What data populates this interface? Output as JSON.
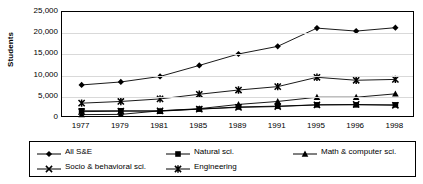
{
  "chart_data": {
    "type": "line",
    "title": "",
    "xlabel": "",
    "ylabel": "Students",
    "categories": [
      "1977",
      "1979",
      "1981",
      "1985",
      "1989",
      "1991",
      "1995",
      "1996",
      "1998"
    ],
    "ylim": [
      0,
      25000
    ],
    "ytick_labels": [
      "25,000",
      "20,000",
      "15,000",
      "10,000",
      "5,000",
      "0"
    ],
    "ytick_values": [
      25000,
      20000,
      15000,
      10000,
      5000,
      0
    ],
    "grid": true,
    "legend_position": "bottom",
    "series": [
      {
        "name": "All S&E",
        "marker": "diamond",
        "values": [
          7800,
          8500,
          9800,
          12400,
          15100,
          16900,
          21200,
          20500,
          21300
        ]
      },
      {
        "name": "Natural sci.",
        "marker": "square",
        "values": [
          1700,
          1700,
          1600,
          2100,
          2600,
          2800,
          3100,
          3100,
          3100
        ]
      },
      {
        "name": "Math & computer sci.",
        "marker": "triangle",
        "values": [
          800,
          850,
          1700,
          2200,
          3200,
          3900,
          4900,
          4900,
          5700
        ]
      },
      {
        "name": "Socio & behavioral sci.",
        "marker": "x",
        "values": [
          1500,
          1600,
          1700,
          2100,
          2500,
          2700,
          3100,
          3200,
          3000
        ]
      },
      {
        "name": "Engineering",
        "marker": "asterisk",
        "values": [
          3500,
          3900,
          4500,
          5600,
          6600,
          7400,
          9600,
          8900,
          9100
        ]
      }
    ]
  },
  "legend": {
    "items": [
      {
        "label": "All S&E",
        "marker": "diamond"
      },
      {
        "label": "Natural sci.",
        "marker": "square"
      },
      {
        "label": "Math & computer sci.",
        "marker": "triangle"
      },
      {
        "label": "Socio & behavioral sci.",
        "marker": "x"
      },
      {
        "label": "Engineering",
        "marker": "asterisk"
      }
    ]
  }
}
